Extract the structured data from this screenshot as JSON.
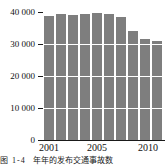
{
  "chart_data": {
    "type": "bar",
    "title": "",
    "subtitle": "",
    "xlabel": "",
    "ylabel": "",
    "categories": [
      "2001",
      "2002",
      "2003",
      "2004",
      "2005",
      "2006",
      "2007",
      "2008",
      "2009",
      "2010"
    ],
    "values": [
      38700,
      39300,
      39200,
      39300,
      39800,
      39300,
      38300,
      34000,
      31500,
      31000
    ],
    "series": [
      {
        "name": "",
        "values": [
          38700,
          39300,
          39200,
          39300,
          39800,
          39300,
          38300,
          34000,
          31500,
          31000
        ]
      }
    ],
    "ylim": [
      0,
      40000
    ],
    "yticks": [
      0,
      10000,
      20000,
      30000,
      40000
    ],
    "ytick_labels": [
      "0",
      "10 000",
      "20 000",
      "30 000",
      "40 000"
    ],
    "xtick_labels": [
      "2001",
      "2005",
      "2010"
    ],
    "xtick_categories": [
      "2001",
      "2005",
      "2010"
    ],
    "grid": true,
    "grid_color": "#ffffff",
    "legend": false,
    "legend_position": "none",
    "bar_color": "#7e7e7e",
    "axis_color": "#1a1a1a",
    "background": "#ffffff"
  },
  "caption": {
    "number": "图 1-4",
    "text": "年年的发布交通事故数"
  }
}
